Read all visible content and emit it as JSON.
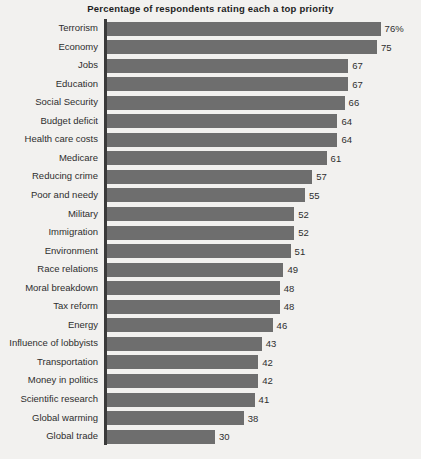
{
  "chart": {
    "title": "Percentage of respondents rating each a top priority",
    "axis_color": "#3a3a3a",
    "bar_color": "#6e6e6e",
    "background_color": "#f2f1ef",
    "text_color": "#2e2e2e"
  },
  "chart_data": {
    "type": "bar",
    "orientation": "horizontal",
    "title": "Percentage of respondents rating each a top priority",
    "xlabel": "",
    "ylabel": "",
    "xlim": [
      0,
      80
    ],
    "grid": false,
    "legend": null,
    "categories": [
      "Terrorism",
      "Economy",
      "Jobs",
      "Education",
      "Social Security",
      "Budget deficit",
      "Health care costs",
      "Medicare",
      "Reducing crime",
      "Poor and needy",
      "Military",
      "Immigration",
      "Environment",
      "Race relations",
      "Moral breakdown",
      "Tax reform",
      "Energy",
      "Influence of lobbyists",
      "Transportation",
      "Money in politics",
      "Scientific research",
      "Global warming",
      "Global trade"
    ],
    "values": [
      76,
      75,
      67,
      67,
      66,
      64,
      64,
      61,
      57,
      55,
      52,
      52,
      51,
      49,
      48,
      48,
      46,
      43,
      42,
      42,
      41,
      38,
      30
    ],
    "value_labels": [
      "76%",
      "75",
      "67",
      "67",
      "66",
      "64",
      "64",
      "61",
      "57",
      "55",
      "52",
      "52",
      "51",
      "49",
      "48",
      "48",
      "46",
      "43",
      "42",
      "42",
      "41",
      "38",
      "30"
    ]
  }
}
